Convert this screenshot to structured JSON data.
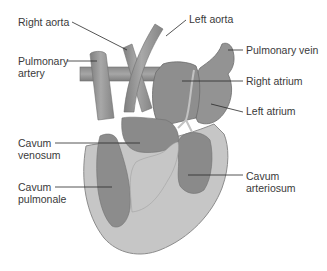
{
  "diagram": {
    "colors": {
      "background": "#ffffff",
      "outer_wall": "#c4c4c4",
      "outer_wall_stroke": "#8a8a8a",
      "chamber": "#8f8f8f",
      "chamber_dark": "#7d7d7d",
      "vessel": "#9a9a9a",
      "vessel_highlight": "#b8b8b8",
      "label_text": "#3a3a3a",
      "leader_line": "#2a2a2a"
    },
    "labels": {
      "right_aorta": {
        "text": "Right aorta"
      },
      "left_aorta": {
        "text": "Left aorta"
      },
      "pulmonary_artery": {
        "line1": "Pulmonary",
        "line2": "artery"
      },
      "pulmonary_vein": {
        "text": "Pulmonary vein"
      },
      "right_atrium": {
        "text": "Right atrium"
      },
      "left_atrium": {
        "text": "Left atrium"
      },
      "cavum_venosum": {
        "line1": "Cavum",
        "line2": "venosum"
      },
      "cavum_pulmonale": {
        "line1": "Cavum",
        "line2": "pulmonale"
      },
      "cavum_arteriosum": {
        "line1": "Cavum",
        "line2": "arteriosum"
      }
    }
  }
}
